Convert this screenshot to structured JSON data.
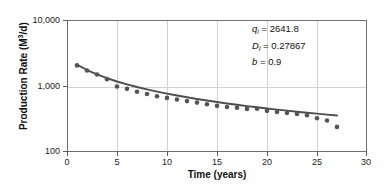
{
  "chart_data": {
    "type": "scatter",
    "title": "",
    "xlabel": "Time (years)",
    "ylabel": "Production Rate (M3/d)",
    "ylabel_display": "Production Rate (M³/d)",
    "xlim": [
      0,
      30
    ],
    "ylim": [
      100,
      10000
    ],
    "yscale": "log",
    "xscale": "linear",
    "grid": true,
    "legend": "none",
    "xticks": [
      0,
      5,
      10,
      15,
      20,
      25,
      30
    ],
    "xticklabels": [
      "0",
      "5",
      "10",
      "15",
      "20",
      "25",
      "30"
    ],
    "yticks": [
      100,
      1000,
      10000
    ],
    "yticklabels": [
      "100",
      "1,000",
      "10,000"
    ],
    "series": [
      {
        "name": "Production data",
        "kind": "scatter",
        "marker": "circle",
        "color": "#555555",
        "x": [
          1,
          2,
          3,
          4,
          5,
          6,
          7,
          8,
          9,
          10,
          11,
          12,
          13,
          14,
          15,
          16,
          17,
          18,
          19,
          20,
          21,
          22,
          23,
          24,
          25,
          26,
          27
        ],
        "y": [
          2050,
          1720,
          1490,
          1270,
          985,
          905,
          820,
          755,
          700,
          660,
          625,
          590,
          560,
          530,
          500,
          480,
          468,
          450,
          452,
          420,
          405,
          390,
          378,
          362,
          325,
          300,
          240
        ]
      },
      {
        "name": "Hyperbolic decline fit",
        "kind": "line",
        "color": "#4d4d4d",
        "x": [
          1,
          2,
          3,
          4,
          5,
          6,
          7,
          8,
          9,
          10,
          11,
          12,
          13,
          14,
          15,
          16,
          17,
          18,
          19,
          20,
          21,
          22,
          23,
          24,
          25,
          26,
          27
        ],
        "y": [
          2102,
          1746,
          1497,
          1313,
          1171,
          1058,
          965,
          888,
          822,
          766,
          717,
          674,
          636,
          602,
          572,
          544,
          519,
          496,
          476,
          457,
          439,
          423,
          408,
          394,
          381,
          369,
          358
        ]
      }
    ],
    "annotations": [
      {
        "name": "qi",
        "symbol": "q",
        "subscript": "i",
        "operator": "=",
        "value": "2641.8",
        "text": "qi = 2641.8"
      },
      {
        "name": "Di",
        "symbol": "D",
        "subscript": "i",
        "operator": "=",
        "value": "0.27867",
        "text": "Di = 0.27867"
      },
      {
        "name": "b",
        "symbol": "b",
        "subscript": "",
        "operator": "=",
        "value": "0.9",
        "text": "b = 0.9"
      }
    ],
    "colors": {
      "marker": "#555555",
      "curve": "#4d4d4d",
      "grid": "#d2d2d2",
      "axis": "#6e6e6e",
      "text": "#1a1a1a",
      "background": "#ffffff"
    }
  }
}
